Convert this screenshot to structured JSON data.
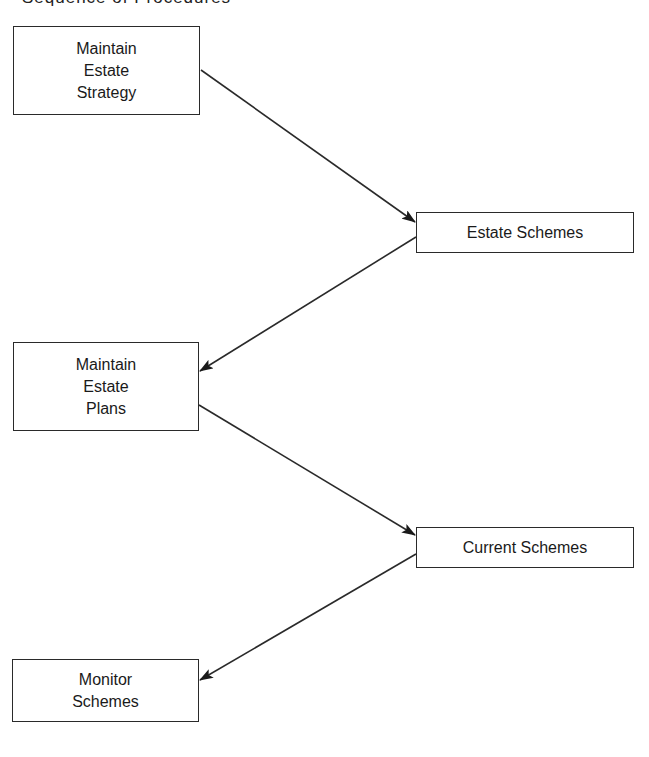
{
  "title": {
    "text": "Sequence of Procedures",
    "clipped": true
  },
  "nodes": [
    {
      "id": "maintain-estate-strategy",
      "type": "procedure",
      "label": "Maintain\nEstate\nStrategy",
      "x": 13,
      "y": 26,
      "w": 187,
      "h": 89
    },
    {
      "id": "estate-schemes",
      "type": "data",
      "label": "Estate Schemes",
      "x": 416,
      "y": 212,
      "w": 218,
      "h": 41
    },
    {
      "id": "maintain-estate-plans",
      "type": "procedure",
      "label": "Maintain\nEstate\nPlans",
      "x": 13,
      "y": 342,
      "w": 186,
      "h": 89
    },
    {
      "id": "current-schemes",
      "type": "data",
      "label": "Current Schemes",
      "x": 416,
      "y": 527,
      "w": 218,
      "h": 41
    },
    {
      "id": "monitor-schemes",
      "type": "procedure",
      "label": "Monitor\nSchemes",
      "x": 12,
      "y": 659,
      "w": 187,
      "h": 63
    }
  ],
  "edges": [
    {
      "from": "maintain-estate-strategy",
      "to": "estate-schemes",
      "x1": 201,
      "y1": 70,
      "x2": 415,
      "y2": 222
    },
    {
      "from": "estate-schemes",
      "to": "maintain-estate-plans",
      "x1": 416,
      "y1": 237,
      "x2": 200,
      "y2": 371
    },
    {
      "from": "maintain-estate-plans",
      "to": "current-schemes",
      "x1": 199,
      "y1": 405,
      "x2": 415,
      "y2": 535
    },
    {
      "from": "current-schemes",
      "to": "monitor-schemes",
      "x1": 416,
      "y1": 554,
      "x2": 200,
      "y2": 680
    }
  ],
  "colors": {
    "line": "#2a2a2a",
    "background": "#ffffff",
    "text": "#1a1a1a"
  }
}
